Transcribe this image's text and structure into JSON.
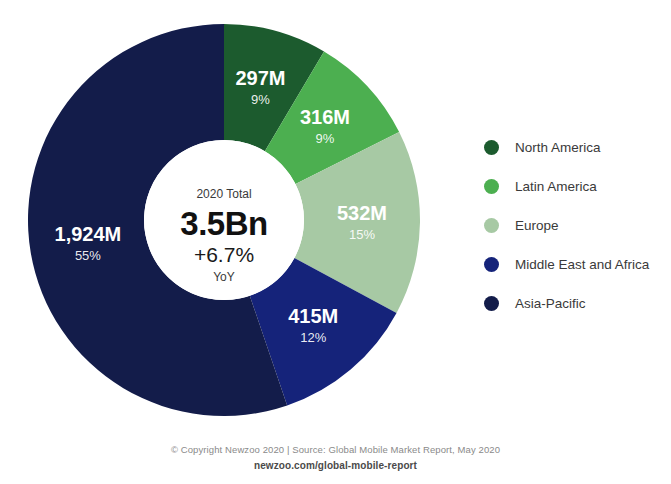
{
  "chart_data": {
    "type": "pie",
    "variant": "donut",
    "title": "",
    "total_label": "2020 Total",
    "total_value": "3.5Bn",
    "growth": "+6.7%",
    "growth_period": "YoY",
    "units": "millions of mobile users",
    "start_angle_deg": 0,
    "direction": "clockwise",
    "categories": [
      "North America",
      "Latin America",
      "Europe",
      "Middle East and Africa",
      "Asia-Pacific"
    ],
    "values": [
      297,
      316,
      532,
      415,
      1924
    ],
    "value_labels": [
      "297M",
      "316M",
      "532M",
      "415M",
      "1,924M"
    ],
    "percent_labels": [
      "9%",
      "9%",
      "15%",
      "12%",
      "55%"
    ],
    "percents": [
      9,
      9,
      15,
      12,
      55
    ],
    "colors": [
      "#1C5B2E",
      "#4CAF50",
      "#A7C9A4",
      "#15237A",
      "#131C4A"
    ],
    "legend_position": "right",
    "grid": false
  },
  "legend": {
    "items": [
      {
        "label": "North America",
        "color": "#1C5B2E"
      },
      {
        "label": "Latin America",
        "color": "#4CAF50"
      },
      {
        "label": "Europe",
        "color": "#A7C9A4"
      },
      {
        "label": "Middle East and Africa",
        "color": "#15237A"
      },
      {
        "label": "Asia-Pacific",
        "color": "#131C4A"
      }
    ]
  },
  "footer": {
    "copyright": "© Copyright Newzoo 2020 | Source: Global Mobile Market Report, May 2020",
    "url": "newzoo.com/global-mobile-report"
  }
}
